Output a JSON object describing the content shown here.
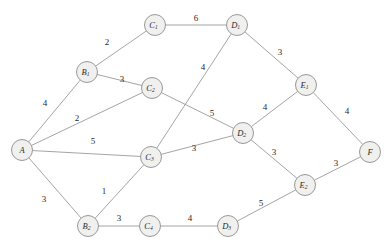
{
  "diagram": {
    "type": "weighted-undirected-graph",
    "title": "",
    "canvas": {
      "width": 390,
      "height": 250,
      "background": "#ffffff"
    },
    "style": {
      "node_fill": "#f0f0ee",
      "node_stroke": "#8d8d8d",
      "edge_stroke": "#9a9a9a",
      "label_color": "#2b2b2b",
      "weight_color": "#1f1f1f",
      "node_radius": 10.5
    },
    "nodes": [
      {
        "id": "A",
        "base": "A",
        "sub": "",
        "x": 22,
        "y": 150
      },
      {
        "id": "B1",
        "base": "B",
        "sub": "1",
        "x": 87,
        "y": 72
      },
      {
        "id": "B2",
        "base": "B",
        "sub": "2",
        "x": 88,
        "y": 226
      },
      {
        "id": "C1",
        "base": "C",
        "sub": "1",
        "x": 155,
        "y": 25
      },
      {
        "id": "C2",
        "base": "C",
        "sub": "2",
        "x": 152,
        "y": 88
      },
      {
        "id": "C3",
        "base": "C",
        "sub": "3",
        "x": 151,
        "y": 157
      },
      {
        "id": "C4",
        "base": "C",
        "sub": "4",
        "x": 150,
        "y": 226
      },
      {
        "id": "D1",
        "base": "D",
        "sub": "1",
        "x": 237,
        "y": 25
      },
      {
        "id": "D2",
        "base": "D",
        "sub": "2",
        "x": 243,
        "y": 133
      },
      {
        "id": "D3",
        "base": "D",
        "sub": "3",
        "x": 228,
        "y": 226
      },
      {
        "id": "E1",
        "base": "E",
        "sub": "1",
        "x": 306,
        "y": 85
      },
      {
        "id": "E2",
        "base": "E",
        "sub": "2",
        "x": 305,
        "y": 185
      },
      {
        "id": "F",
        "base": "F",
        "sub": "",
        "x": 370,
        "y": 152
      }
    ],
    "edges": [
      {
        "from": "A",
        "to": "B1",
        "weight": "4",
        "lx": 45,
        "ly": 103
      },
      {
        "from": "A",
        "to": "C2",
        "weight": "2",
        "lx": 77,
        "ly": 118
      },
      {
        "from": "A",
        "to": "C3",
        "weight": "5",
        "lx": 93,
        "ly": 141
      },
      {
        "from": "A",
        "to": "B2",
        "weight": "3",
        "lx": 44,
        "ly": 199
      },
      {
        "from": "B1",
        "to": "C1",
        "weight": "2",
        "lx": 107,
        "ly": 42
      },
      {
        "from": "B1",
        "to": "C2",
        "weight": "3",
        "lx": 122,
        "ly": 79
      },
      {
        "from": "C1",
        "to": "D1",
        "weight": "6",
        "lx": 196,
        "ly": 18
      },
      {
        "from": "C2",
        "to": "D2",
        "weight": "5",
        "lx": 212,
        "ly": 113
      },
      {
        "from": "D1",
        "to": "C3",
        "weight": "4",
        "lx": 203,
        "ly": 67
      },
      {
        "from": "D1",
        "to": "E1",
        "weight": "3",
        "lx": 280,
        "ly": 52
      },
      {
        "from": "C3",
        "to": "D2",
        "weight": "3",
        "lx": 194,
        "ly": 148
      },
      {
        "from": "C3",
        "to": "B2",
        "weight": "1",
        "lx": 104,
        "ly": 191
      },
      {
        "from": "D2",
        "to": "E1",
        "weight": "4",
        "lx": 265,
        "ly": 107
      },
      {
        "from": "D2",
        "to": "E2",
        "weight": "3",
        "lx": 274,
        "ly": 152
      },
      {
        "from": "E1",
        "to": "F",
        "weight": "4",
        "lx": 347,
        "ly": 111
      },
      {
        "from": "E2",
        "to": "F",
        "weight": "3",
        "lx": 336,
        "ly": 163
      },
      {
        "from": "E2",
        "to": "D3",
        "weight": "5",
        "lx": 261,
        "ly": 203
      },
      {
        "from": "B2",
        "to": "C4",
        "weight": "3",
        "lx": 119,
        "ly": 218
      },
      {
        "from": "C4",
        "to": "D3",
        "weight": "4",
        "lx": 190,
        "ly": 218
      }
    ]
  }
}
